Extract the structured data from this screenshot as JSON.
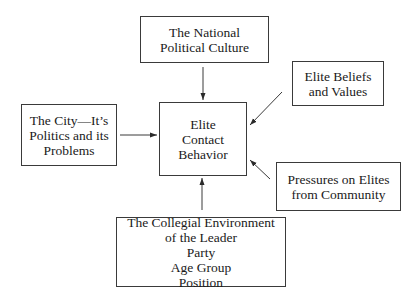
{
  "diagram": {
    "nodes": {
      "national": {
        "lines": [
          "The National",
          "Political Culture"
        ]
      },
      "city": {
        "lines": [
          "The City—It’s",
          "Politics and its",
          "Problems"
        ]
      },
      "center": {
        "lines": [
          "Elite",
          "Contact",
          "Behavior"
        ]
      },
      "beliefs": {
        "lines": [
          "Elite Beliefs",
          "and Values"
        ]
      },
      "pressures": {
        "lines": [
          "Pressures on Elites",
          "from Community"
        ]
      },
      "collegial": {
        "lines": [
          "The Collegial Environment",
          "of the Leader"
        ],
        "sub_items": [
          "Party",
          "Age Group",
          "Position"
        ]
      }
    },
    "edges": [
      {
        "from": "national",
        "to": "center",
        "direction": "down"
      },
      {
        "from": "city",
        "to": "center",
        "direction": "right"
      },
      {
        "from": "beliefs",
        "to": "center",
        "direction": "down-left"
      },
      {
        "from": "pressures",
        "to": "center",
        "direction": "up-left"
      },
      {
        "from": "collegial",
        "to": "center",
        "direction": "up"
      }
    ],
    "colors": {
      "line": "#3a3a3a",
      "background": "#ffffff",
      "text": "#1a1a1a"
    }
  }
}
